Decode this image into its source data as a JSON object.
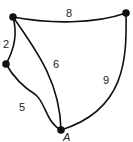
{
  "diagram": {
    "type": "weighted-graph",
    "nodes": [
      {
        "id": "top-left",
        "label": ""
      },
      {
        "id": "top-right",
        "label": ""
      },
      {
        "id": "left-mid",
        "label": ""
      },
      {
        "id": "bottom",
        "label": "A"
      }
    ],
    "edges": [
      {
        "from": "top-left",
        "to": "top-right",
        "weight": "8"
      },
      {
        "from": "top-left",
        "to": "left-mid",
        "weight": "2"
      },
      {
        "from": "top-left",
        "to": "bottom",
        "weight": "6"
      },
      {
        "from": "top-right",
        "to": "bottom",
        "weight": "9"
      },
      {
        "from": "left-mid",
        "to": "bottom",
        "weight": "5"
      }
    ],
    "colors": {
      "stroke": "#111111",
      "background": "#ffffff"
    }
  }
}
